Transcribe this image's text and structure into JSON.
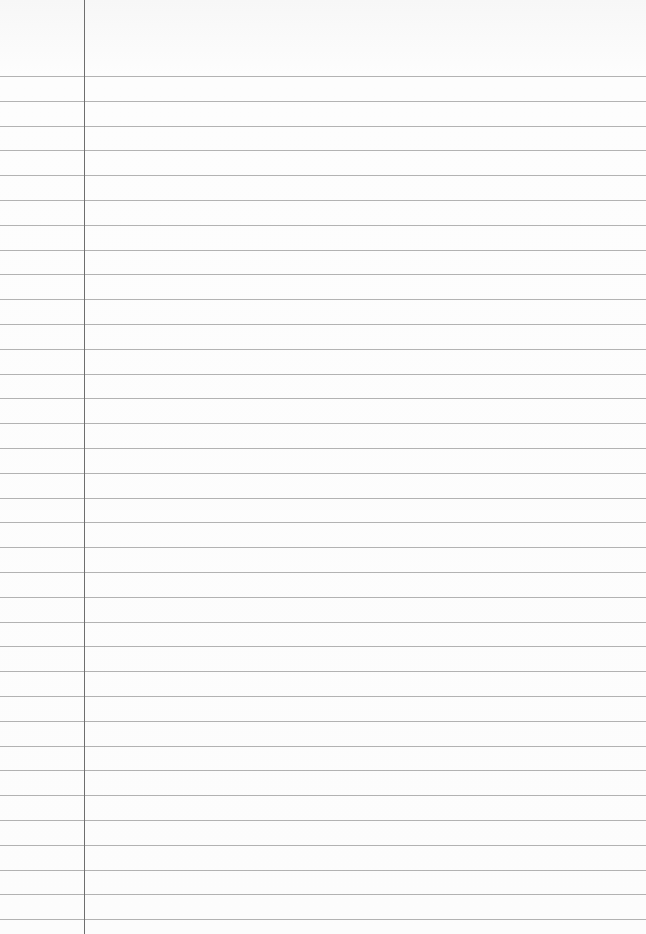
{
  "paper": {
    "type": "lined-paper",
    "background_color": "#fbfbfb",
    "rule_color": "#9a9a9a",
    "margin_color": "#6e6e6e",
    "margin_x": 84,
    "first_rule_y": 76,
    "rule_spacing": 24.8,
    "rule_count": 35
  }
}
